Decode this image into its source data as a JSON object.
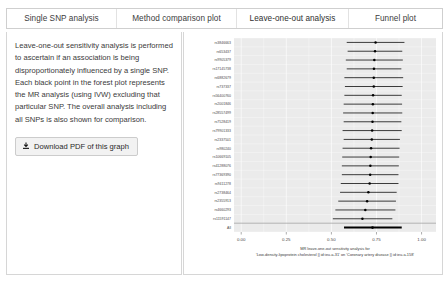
{
  "tabs": [
    {
      "label": "Single SNP analysis",
      "active": false
    },
    {
      "label": "Method comparison plot",
      "active": false
    },
    {
      "label": "Leave-one-out analysis",
      "active": true
    },
    {
      "label": "Funnel plot",
      "active": false
    }
  ],
  "left_panel": {
    "description": "Leave-one-out sensitivity analysis is performed to ascertain if an association is being disproportionately influenced by a single SNP. Each black point in the forest plot represents the MR analysis (using IVW) excluding that particular SNP. The overall analysis including all SNPs is also shown for comparison.",
    "download_label": "Download PDF of this graph",
    "download_icon": "download-icon"
  },
  "chart_data": {
    "type": "scatter",
    "title": "",
    "caption_line1": "MR leave-one-out sensitivity analysis for",
    "caption_line2": "'Low-density-lipoprotein cholesterol || id:ieu-a-31' on 'Coronary artery disease || id:ieu-a-158'",
    "xlabel": "",
    "ylabel": "",
    "xlim": [
      -0.04,
      1.08
    ],
    "xticks": [
      0.0,
      0.25,
      0.5,
      0.75,
      1.0
    ],
    "xticklabels": [
      "0.00",
      "0.25",
      "0.50",
      "0.75",
      "1.00"
    ],
    "grid": true,
    "legend": "none",
    "orientation": "horizontal-forest",
    "categories": [
      "rs3846663",
      "rs653437",
      "rs9905379",
      "rs17145738",
      "rs6882679",
      "rs737337",
      "rs56400760",
      "rs2001846",
      "rs28557499",
      "rs7528419",
      "rs79901333",
      "rs2337501",
      "rs980240",
      "rs10669105",
      "rs41288076",
      "rs77369390",
      "rs9411278",
      "rs2738464",
      "rs2355913",
      "rs4660293",
      "rs11591147",
      "rs1250229",
      "All"
    ],
    "points": [
      {
        "label": "rs3846663",
        "estimate": 0.745,
        "lo": 0.585,
        "hi": 0.905
      },
      {
        "label": "rs653437",
        "estimate": 0.742,
        "lo": 0.59,
        "hi": 0.893
      },
      {
        "label": "rs9905379",
        "estimate": 0.738,
        "lo": 0.58,
        "hi": 0.896
      },
      {
        "label": "rs17145738",
        "estimate": 0.736,
        "lo": 0.585,
        "hi": 0.888
      },
      {
        "label": "rs6882679",
        "estimate": 0.735,
        "lo": 0.572,
        "hi": 0.898
      },
      {
        "label": "rs737337",
        "estimate": 0.735,
        "lo": 0.575,
        "hi": 0.895
      },
      {
        "label": "rs56400760",
        "estimate": 0.731,
        "lo": 0.572,
        "hi": 0.89
      },
      {
        "label": "rs2001846",
        "estimate": 0.73,
        "lo": 0.568,
        "hi": 0.892
      },
      {
        "label": "rs28557499",
        "estimate": 0.729,
        "lo": 0.565,
        "hi": 0.893
      },
      {
        "label": "rs7528419",
        "estimate": 0.728,
        "lo": 0.568,
        "hi": 0.888
      },
      {
        "label": "rs79901333",
        "estimate": 0.726,
        "lo": 0.562,
        "hi": 0.89
      },
      {
        "label": "rs2337501",
        "estimate": 0.724,
        "lo": 0.568,
        "hi": 0.88
      },
      {
        "label": "rs980240",
        "estimate": 0.72,
        "lo": 0.562,
        "hi": 0.878
      },
      {
        "label": "rs10669105",
        "estimate": 0.718,
        "lo": 0.56,
        "hi": 0.876
      },
      {
        "label": "rs41288076",
        "estimate": 0.716,
        "lo": 0.558,
        "hi": 0.874
      },
      {
        "label": "rs77369390",
        "estimate": 0.715,
        "lo": 0.558,
        "hi": 0.872
      },
      {
        "label": "rs9411278",
        "estimate": 0.712,
        "lo": 0.552,
        "hi": 0.872
      },
      {
        "label": "rs2738464",
        "estimate": 0.705,
        "lo": 0.548,
        "hi": 0.862
      },
      {
        "label": "rs2355913",
        "estimate": 0.698,
        "lo": 0.538,
        "hi": 0.858
      },
      {
        "label": "rs4660293",
        "estimate": 0.688,
        "lo": 0.522,
        "hi": 0.855
      },
      {
        "label": "rs11591147",
        "estimate": 0.672,
        "lo": 0.508,
        "hi": 0.838
      },
      {
        "label": "All",
        "estimate": 0.728,
        "lo": 0.57,
        "hi": 0.89
      }
    ]
  }
}
